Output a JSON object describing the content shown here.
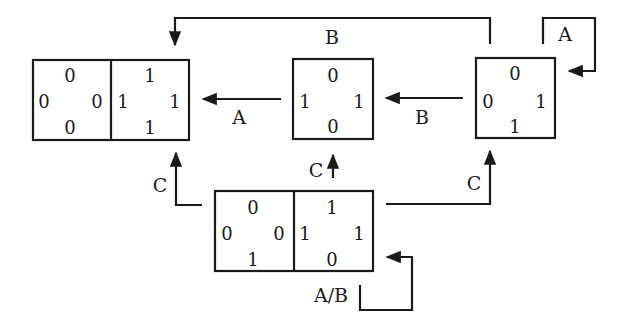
{
  "diagram": {
    "type": "state-transition",
    "colors": {
      "ink": "#1a1a1a",
      "background": "#ffffff"
    },
    "states": [
      {
        "id": "left",
        "cells": [
          {
            "top": "0",
            "left": "0",
            "right": "0",
            "bottom": "0"
          },
          {
            "top": "1",
            "left": "1",
            "right": "1",
            "bottom": "1"
          }
        ]
      },
      {
        "id": "middle",
        "cells": [
          {
            "top": "0",
            "left": "1",
            "right": "1",
            "bottom": "0"
          }
        ]
      },
      {
        "id": "right",
        "cells": [
          {
            "top": "0",
            "left": "0",
            "right": "1",
            "bottom": "1"
          }
        ]
      },
      {
        "id": "bottom",
        "cells": [
          {
            "top": "0",
            "left": "0",
            "right": "0",
            "bottom": "1"
          },
          {
            "top": "1",
            "left": "1",
            "right": "1",
            "bottom": "0"
          }
        ]
      }
    ],
    "transitions": [
      {
        "from": "right",
        "to": "left",
        "label": "B",
        "route": "top"
      },
      {
        "from": "right",
        "to": "right",
        "label": "A",
        "route": "self-loop"
      },
      {
        "from": "middle",
        "to": "left",
        "label": "A"
      },
      {
        "from": "right",
        "to": "middle",
        "label": "B"
      },
      {
        "from": "bottom",
        "to": "left",
        "label": "C"
      },
      {
        "from": "bottom",
        "to": "middle",
        "label": "C"
      },
      {
        "from": "bottom",
        "to": "right",
        "label": "C"
      },
      {
        "from": "bottom",
        "to": "bottom",
        "label": "A/B",
        "route": "self-loop"
      }
    ]
  }
}
